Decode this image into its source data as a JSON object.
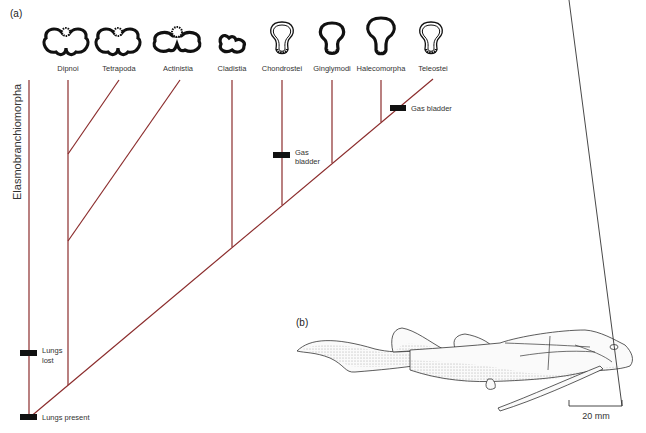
{
  "figure": {
    "panel_a_label": "(a)",
    "panel_b_label": "(b)",
    "outgroup_label": "Elasmobranchiomorpha",
    "line_color": "#8b2c2c",
    "taxa": [
      {
        "name": "Dipnoi",
        "lung_icon": "paired-lung-icon"
      },
      {
        "name": "Tetrapoda",
        "lung_icon": "paired-lung-icon"
      },
      {
        "name": "Actinistia",
        "lung_icon": "paired-lung-icon"
      },
      {
        "name": "Cladistia",
        "lung_icon": "paired-lung-icon"
      },
      {
        "name": "Chondrostei",
        "lung_icon": "gas-bladder-icon"
      },
      {
        "name": "Ginglymodi",
        "lung_icon": "gas-bladder-icon"
      },
      {
        "name": "Halecomorpha",
        "lung_icon": "gas-bladder-icon"
      },
      {
        "name": "Teleostei",
        "lung_icon": "gas-bladder-icon"
      }
    ],
    "characters": {
      "lungs_present": "Lungs present",
      "lungs_lost_line1": "Lungs",
      "lungs_lost_line2": "lost",
      "gas_bladder_chondrostei_line1": "Gas",
      "gas_bladder_chondrostei_line2": "bladder",
      "gas_bladder_teleostei": "Gas bladder"
    },
    "scale_bar": "20 mm"
  }
}
